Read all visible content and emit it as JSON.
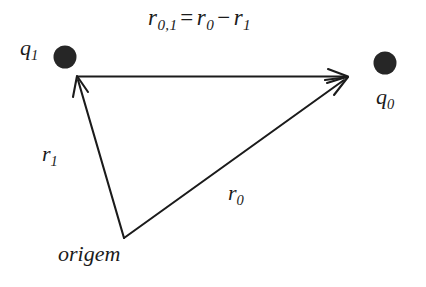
{
  "figure": {
    "background_color": "#ffffff",
    "ink_color": "#1b1b1b",
    "equation": {
      "lhs_symbol": "r",
      "lhs_subscript": "0,1",
      "equals": "=",
      "term1_symbol": "r",
      "term1_subscript": "0",
      "operator": "−",
      "term2_symbol": "r",
      "term2_subscript": "1",
      "full_text": "r0,1 = r0 − r1"
    },
    "charges": [
      {
        "name": "charge-q1",
        "label_symbol": "q",
        "label_subscript": "1",
        "cx": 65,
        "cy": 57,
        "r": 11,
        "color": "#262626"
      },
      {
        "name": "charge-q0",
        "label_symbol": "q",
        "label_subscript": "0",
        "cx": 385,
        "cy": 63,
        "r": 11,
        "color": "#262626"
      }
    ],
    "origin": {
      "label": "origem",
      "x": 124,
      "y": 238
    },
    "vectors": [
      {
        "name": "vector-r01",
        "label_symbol": "r",
        "label_subscript": "0,1",
        "from_x": 77,
        "from_y": 76,
        "to_x": 348,
        "to_y": 76,
        "description": "horizontal vector from q1 to q0"
      },
      {
        "name": "vector-r1",
        "label_symbol": "r",
        "label_subscript": "1",
        "from_x": 124,
        "from_y": 238,
        "to_x": 77,
        "to_y": 77,
        "description": "vector from origin to q1"
      },
      {
        "name": "vector-r0",
        "label_symbol": "r",
        "label_subscript": "0",
        "from_x": 124,
        "from_y": 238,
        "to_x": 348,
        "to_y": 78,
        "description": "vector from origin to q0"
      }
    ]
  }
}
